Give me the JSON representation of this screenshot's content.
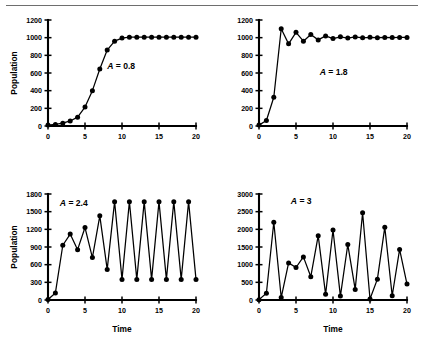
{
  "figure": {
    "background_color": "#ffffff",
    "ink_color": "#000000",
    "rule_color": "#6e6e6e"
  },
  "chart_data": [
    {
      "type": "line",
      "panel_id": "A-0.8",
      "title": "",
      "annotation": "A = 0.8",
      "annotation_variable": "A",
      "annotation_value": "0.8",
      "xlabel": "",
      "ylabel": "Population",
      "xlim": [
        0,
        20
      ],
      "ylim": [
        0,
        1200
      ],
      "xticks": [
        0,
        5,
        10,
        15,
        20
      ],
      "yticks": [
        0,
        200,
        400,
        600,
        800,
        1000,
        1200
      ],
      "grid": false,
      "legend": "none",
      "markers": "filled-circle",
      "x": [
        0,
        1,
        2,
        3,
        4,
        5,
        6,
        7,
        8,
        9,
        10,
        11,
        12,
        13,
        14,
        15,
        16,
        17,
        18,
        19,
        20
      ],
      "values": [
        10,
        18,
        32,
        57,
        100,
        215,
        400,
        645,
        860,
        960,
        995,
        1005,
        1005,
        1005,
        1005,
        1005,
        1005,
        1005,
        1005,
        1005,
        1005
      ]
    },
    {
      "type": "line",
      "panel_id": "A-1.8",
      "title": "",
      "annotation": "A = 1.8",
      "annotation_variable": "A",
      "annotation_value": "1.8",
      "xlabel": "",
      "ylabel": "",
      "xlim": [
        0,
        20
      ],
      "ylim": [
        0,
        1200
      ],
      "xticks": [
        0,
        5,
        10,
        15,
        20
      ],
      "yticks": [
        0,
        200,
        400,
        600,
        800,
        1000,
        1200
      ],
      "grid": false,
      "legend": "none",
      "markers": "filled-circle",
      "x": [
        0,
        1,
        2,
        3,
        4,
        5,
        6,
        7,
        8,
        9,
        10,
        11,
        12,
        13,
        14,
        15,
        16,
        17,
        18,
        19,
        20
      ],
      "values": [
        10,
        62,
        325,
        1100,
        930,
        1060,
        960,
        1035,
        975,
        1020,
        990,
        1010,
        995,
        1008,
        998,
        1004,
        1000,
        1003,
        1001,
        1002,
        1002
      ]
    },
    {
      "type": "line",
      "panel_id": "A-2.4",
      "title": "",
      "annotation": "A = 2.4",
      "annotation_variable": "A",
      "annotation_value": "2.4",
      "xlabel": "Time",
      "ylabel": "Population",
      "xlim": [
        0,
        20
      ],
      "ylim": [
        0,
        1800
      ],
      "xticks": [
        0,
        5,
        10,
        15,
        20
      ],
      "yticks": [
        0,
        300,
        600,
        900,
        1200,
        1500,
        1800
      ],
      "grid": false,
      "legend": "none",
      "markers": "filled-circle",
      "x": [
        0,
        1,
        2,
        3,
        4,
        5,
        6,
        7,
        8,
        9,
        10,
        11,
        12,
        13,
        14,
        15,
        16,
        17,
        18,
        19,
        20
      ],
      "values": [
        10,
        120,
        930,
        1120,
        855,
        1230,
        720,
        1430,
        520,
        1670,
        350,
        1670,
        350,
        1670,
        350,
        1670,
        350,
        1670,
        350,
        1670,
        350
      ]
    },
    {
      "type": "line",
      "panel_id": "A-3",
      "title": "",
      "annotation": "A = 3",
      "annotation_variable": "A",
      "annotation_value": "3",
      "xlabel": "Time",
      "ylabel": "",
      "xlim": [
        0,
        20
      ],
      "ylim": [
        0,
        3000
      ],
      "xticks": [
        0,
        5,
        10,
        15,
        20
      ],
      "yticks": [
        0,
        500,
        1000,
        1500,
        2000,
        2500,
        3000
      ],
      "grid": false,
      "legend": "none",
      "markers": "filled-circle",
      "x": [
        0,
        1,
        2,
        3,
        4,
        5,
        6,
        7,
        8,
        9,
        10,
        11,
        12,
        13,
        14,
        15,
        16,
        17,
        18,
        19,
        20
      ],
      "values": [
        10,
        190,
        2200,
        70,
        1050,
        920,
        1220,
        660,
        1820,
        160,
        1980,
        110,
        1570,
        300,
        2470,
        30,
        590,
        2060,
        120,
        1430,
        450
      ]
    }
  ]
}
